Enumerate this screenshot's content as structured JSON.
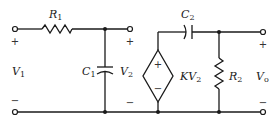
{
  "diagram": {
    "type": "circuit-schematic",
    "components": {
      "R1": {
        "name": "R",
        "sub": "1"
      },
      "C1": {
        "name": "C",
        "sub": "1"
      },
      "C2": {
        "name": "C",
        "sub": "2"
      },
      "R2": {
        "name": "R",
        "sub": "2"
      },
      "source": {
        "name": "KV",
        "sub": "2"
      }
    },
    "voltages": {
      "V1": {
        "name": "V",
        "sub": "1"
      },
      "V2": {
        "name": "V",
        "sub": "2"
      },
      "Vo": {
        "name": "V",
        "sub": "o"
      }
    },
    "signs": {
      "plus": "+",
      "minus": "−"
    },
    "colors": {
      "ink": "#1a1a1a",
      "background": "#ffffff"
    }
  }
}
